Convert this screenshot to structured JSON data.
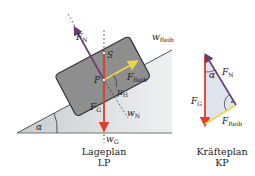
{
  "diagram": {
    "lageplan": {
      "caption_line1": "Lageplan",
      "caption_line2": "LP",
      "labels": {
        "fn": "F",
        "fn_sub": "N",
        "s": "S",
        "p": "P",
        "freib": "F",
        "freib_sub": "Reib",
        "mu": "μ",
        "mu_sub": "H",
        "fg": "F",
        "fg_sub": "G",
        "wn": "w",
        "wn_sub": "N",
        "wg": "w",
        "wg_sub": "G",
        "wreib": "w",
        "wreib_sub": "Reib",
        "alpha": "α"
      }
    },
    "kraefteplan": {
      "caption_line1": "Kräfteplan",
      "caption_line2": "KP",
      "labels": {
        "fn": "F",
        "fn_sub": "N",
        "fg": "F",
        "fg_sub": "G",
        "freib": "F",
        "freib_sub": "Reib",
        "alpha": "α"
      }
    },
    "colors": {
      "gravity": "#d9412b",
      "normal": "#6b3a73",
      "friction": "#e6d84a",
      "block": "#8e8e8e",
      "incline": "#d6d8da"
    }
  }
}
